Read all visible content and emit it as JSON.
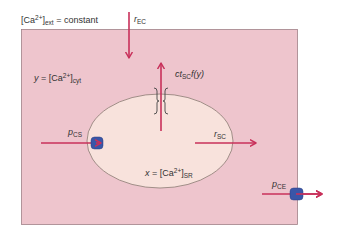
{
  "diagram": {
    "type": "calcium-compartment-model",
    "colors": {
      "cytosol_fill": "#eec5cd",
      "cytosol_border": "#a08088",
      "sr_fill": "#f8e2dc",
      "sr_border": "#8a7a72",
      "arrow": "#c8305a",
      "transporter": "#3a56a8",
      "text": "#333333"
    },
    "labels": {
      "ext": {
        "prefix": "[Ca",
        "sup": "2+",
        "bracket": "]",
        "sub": "ext",
        "suffix": " = constant"
      },
      "cyt": {
        "var": "y",
        "eq": " = [Ca",
        "sup": "2+",
        "bracket": "]",
        "sub": "cyt"
      },
      "sr": {
        "var": "x",
        "eq": " = [Ca",
        "sup": "2+",
        "bracket": "]",
        "sub": "SR"
      },
      "r_ec": {
        "main": "r",
        "sub": "EC"
      },
      "ct_sc": {
        "main": "ct",
        "sub": "SC",
        "suffix": "f(y)"
      },
      "p_cs": {
        "main": "p",
        "sub": "CS"
      },
      "r_sc": {
        "main": "r",
        "sub": "SC"
      },
      "p_ce": {
        "main": "p",
        "sub": "CE"
      }
    },
    "flows": [
      {
        "id": "r_EC",
        "from": "extracellular",
        "to": "cytosol",
        "direction": "down"
      },
      {
        "id": "ct_SC_f(y)",
        "from": "SR",
        "to": "cytosol",
        "direction": "up",
        "via": "channel"
      },
      {
        "id": "p_CS",
        "from": "cytosol",
        "to": "SR",
        "direction": "right",
        "via": "pump"
      },
      {
        "id": "r_SC",
        "from": "SR",
        "to": "cytosol",
        "direction": "right"
      },
      {
        "id": "p_CE",
        "from": "cytosol",
        "to": "extracellular",
        "direction": "right",
        "via": "pump"
      }
    ]
  }
}
